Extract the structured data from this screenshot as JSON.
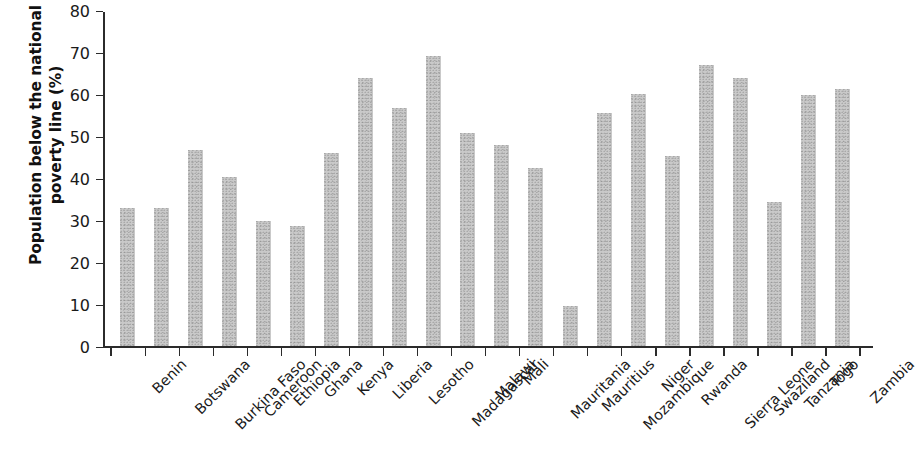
{
  "chart_data": {
    "type": "bar",
    "title": "",
    "xlabel": "",
    "ylabel": "Population below the national poverty line (%)",
    "ylabel_line1": "Population below the national",
    "ylabel_line2": "poverty line (%)",
    "ylim": [
      0,
      80
    ],
    "ytick_labels": [
      "0",
      "10",
      "20",
      "30",
      "40",
      "50",
      "60",
      "70",
      "80"
    ],
    "yticks": [
      0,
      10,
      20,
      30,
      40,
      50,
      60,
      70,
      80
    ],
    "grid": false,
    "legend": "none",
    "bar_color": "#c9c9c9",
    "axis_color": "#2b2b2b",
    "categories": [
      "Benin",
      "Botswana",
      "Burkina Faso",
      "Cameroon",
      "Ethiopia",
      "Ghana",
      "Kenya",
      "Liberia",
      "Lesotho",
      "Madagascar",
      "Malawi",
      "Mali",
      "Mauritania",
      "Mauritius",
      "Mozambique",
      "Niger",
      "Rwanda",
      "Sierra Leone",
      "Swaziland",
      "Tanzania",
      "Togo",
      "Zambia"
    ],
    "values": [
      33.0,
      33.0,
      46.7,
      40.3,
      29.8,
      28.6,
      46.0,
      63.8,
      56.8,
      69.2,
      50.9,
      47.9,
      42.4,
      9.6,
      55.5,
      60.0,
      45.4,
      67.1,
      63.9,
      34.5,
      59.9,
      61.4
    ]
  }
}
